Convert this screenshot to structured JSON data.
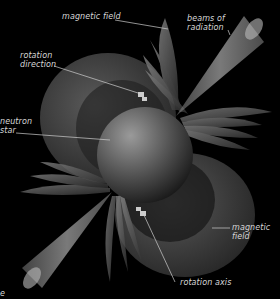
{
  "diagram": {
    "labels": {
      "magnetic_field_top": "magnetic field",
      "beams_of_radiation": "beams of\nradiation",
      "rotation_direction": "rotation\ndirection",
      "neutron_star": "neutron\nstar",
      "magnetic_field_right": "magnetic\nfield",
      "rotation_axis": "rotation axis",
      "corner_fragment": "e"
    }
  }
}
